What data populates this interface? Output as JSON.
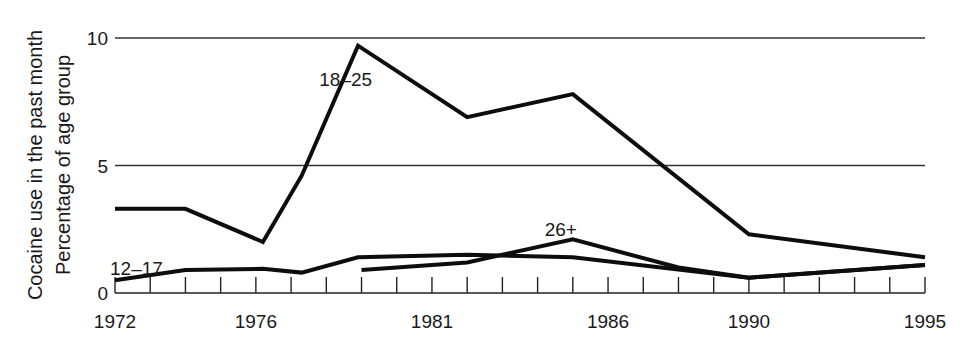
{
  "chart_data": {
    "type": "line",
    "title": "",
    "xlabel": "",
    "ylabel": "Cocaine use in the past month\nPercentage of age group",
    "ylabel_lines": [
      "Cocaine use in the past month",
      "Percentage of age group"
    ],
    "xlim": [
      1972,
      1995
    ],
    "ylim": [
      0,
      10
    ],
    "x_tick_labels": [
      "1972",
      "1976",
      "1981",
      "1986",
      "1990",
      "1995"
    ],
    "x_tick_label_years": [
      1972,
      1976,
      1981,
      1986,
      1990,
      1995
    ],
    "x_minor_ticks": "annual",
    "y_tick_labels": [
      "0",
      "5",
      "10"
    ],
    "y_tick_values": [
      0,
      5,
      10
    ],
    "grid": "horizontal at 5 and 10",
    "legend": "inline labels",
    "series": [
      {
        "name": "18–25",
        "label_pos": [
          1977.8,
          8.4
        ],
        "points": [
          [
            1972,
            3.3
          ],
          [
            1974,
            3.3
          ],
          [
            1976.2,
            2.0
          ],
          [
            1977.3,
            4.6
          ],
          [
            1978.9,
            9.7
          ],
          [
            1982,
            6.9
          ],
          [
            1985,
            7.8
          ],
          [
            1990,
            2.3
          ],
          [
            1995,
            1.4
          ]
        ]
      },
      {
        "name": "12–17",
        "label_pos": [
          1972,
          1.0
        ],
        "points": [
          [
            1972,
            0.5
          ],
          [
            1974,
            0.9
          ],
          [
            1976.2,
            0.95
          ],
          [
            1977.3,
            0.8
          ],
          [
            1978.9,
            1.4
          ],
          [
            1982,
            1.5
          ],
          [
            1985,
            1.4
          ],
          [
            1990,
            0.6
          ],
          [
            1995,
            1.1
          ]
        ]
      },
      {
        "name": "26+",
        "label_pos": [
          1984.2,
          2.5
        ],
        "points": [
          [
            1979,
            0.9
          ],
          [
            1982,
            1.2
          ],
          [
            1985,
            2.1
          ],
          [
            1988,
            1.0
          ],
          [
            1990,
            0.6
          ],
          [
            1995,
            1.1
          ]
        ]
      }
    ]
  }
}
